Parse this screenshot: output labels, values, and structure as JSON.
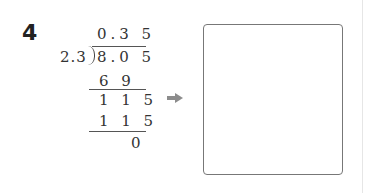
{
  "problem": {
    "number": "4",
    "long_division": {
      "quotient": "0.3 5",
      "divisor": "2.3",
      "dividend": "8.0 5",
      "steps": [
        {
          "value": "6 9"
        },
        {
          "value": "1 1 5"
        },
        {
          "value": "1 1 5"
        },
        {
          "value": "0"
        }
      ]
    },
    "arrow_icon": "right-arrow-icon",
    "answer_box": ""
  },
  "colors": {
    "text": "#333333",
    "arrow": "#8c8c8c",
    "box_border": "#777777"
  }
}
